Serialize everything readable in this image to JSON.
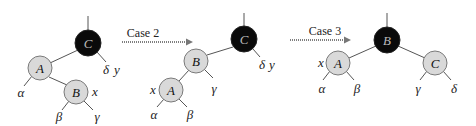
{
  "transitions": [
    {
      "label": "Case 2"
    },
    {
      "label": "Case 3"
    }
  ],
  "trees": [
    {
      "name": "before-case-2",
      "nodes": [
        {
          "id": "C",
          "label": "C",
          "color": "black"
        },
        {
          "id": "A",
          "label": "A",
          "color": "red"
        },
        {
          "id": "B",
          "label": "B",
          "color": "red"
        }
      ],
      "edges": [
        [
          "C",
          "A"
        ],
        [
          "A",
          "B"
        ]
      ],
      "subtrees": [
        "α",
        "β",
        "γ",
        "δ"
      ],
      "annotations": {
        "x": "x",
        "y": "y"
      }
    },
    {
      "name": "after-case-2",
      "nodes": [
        {
          "id": "C",
          "label": "C",
          "color": "black"
        },
        {
          "id": "B",
          "label": "B",
          "color": "red"
        },
        {
          "id": "A",
          "label": "A",
          "color": "red"
        }
      ],
      "edges": [
        [
          "C",
          "B"
        ],
        [
          "B",
          "A"
        ]
      ],
      "subtrees": [
        "α",
        "β",
        "γ",
        "δ"
      ],
      "annotations": {
        "x": "x",
        "y": "y"
      }
    },
    {
      "name": "after-case-3",
      "nodes": [
        {
          "id": "B",
          "label": "B",
          "color": "black"
        },
        {
          "id": "A",
          "label": "A",
          "color": "red"
        },
        {
          "id": "C",
          "label": "C",
          "color": "red"
        }
      ],
      "edges": [
        [
          "B",
          "A"
        ],
        [
          "B",
          "C"
        ]
      ],
      "subtrees": [
        "α",
        "β",
        "γ",
        "δ"
      ],
      "annotations": {
        "x": "x"
      }
    }
  ],
  "colors": {
    "black_node": "#0a0a0a",
    "red_node": "#d9d9d9",
    "edge": "#555555"
  }
}
